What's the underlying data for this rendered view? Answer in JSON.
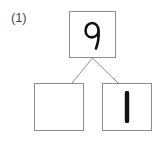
{
  "worksheet": {
    "problem_label": "(1)",
    "type": "number-bond",
    "background_color": "#ffffff",
    "border_color": "#8c8c8c",
    "ink_color": "#111111",
    "label_color": "#4a4a4a"
  },
  "number_bond": {
    "whole": {
      "value": "9",
      "filled": true,
      "position": "top"
    },
    "parts": [
      {
        "value": "",
        "filled": false,
        "position": "bottom-left"
      },
      {
        "value": "1",
        "filled": true,
        "position": "bottom-right"
      }
    ],
    "connectors": [
      {
        "from": "whole",
        "to": "bottom-left"
      },
      {
        "from": "whole",
        "to": "bottom-right"
      }
    ]
  }
}
